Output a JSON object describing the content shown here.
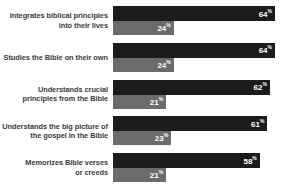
{
  "chart_data": {
    "type": "bar",
    "orientation": "horizontal",
    "title": "",
    "subtitle": "",
    "xlabel": "",
    "ylabel": "",
    "xlim": [
      0,
      100
    ],
    "grid": false,
    "legend": false,
    "legend_position": "none",
    "value_suffix": "%",
    "categories": [
      "Integrates biblical principles into their lives",
      "Studies the Bible on their own",
      "Understands crucial principles from the Bible",
      "Understands the big picture of the gospel in the Bible",
      "Memorizes Bible verses or creeds"
    ],
    "series": [
      {
        "name": "primary",
        "color": "#1b1b1b",
        "values": [
          64,
          64,
          62,
          61,
          58
        ]
      },
      {
        "name": "secondary",
        "color": "#6b6b6b",
        "values": [
          24,
          24,
          21,
          23,
          21
        ]
      }
    ]
  },
  "rows": [
    {
      "label_line1": "Integrates biblical principles",
      "label_line2": "into their lives",
      "primary_value": "64",
      "secondary_value": "24",
      "pct": "%"
    },
    {
      "label_line1": "Studies the Bible on their own",
      "label_line2": "",
      "primary_value": "64",
      "secondary_value": "24",
      "pct": "%"
    },
    {
      "label_line1": "Understands crucial",
      "label_line2": "principles from the Bible",
      "primary_value": "62",
      "secondary_value": "21",
      "pct": "%"
    },
    {
      "label_line1": "Understands the big picture of",
      "label_line2": "the gospel in the Bible",
      "primary_value": "61",
      "secondary_value": "23",
      "pct": "%"
    },
    {
      "label_line1": "Memorizes Bible verses",
      "label_line2": "or creeds",
      "primary_value": "58",
      "secondary_value": "21",
      "pct": "%"
    }
  ]
}
